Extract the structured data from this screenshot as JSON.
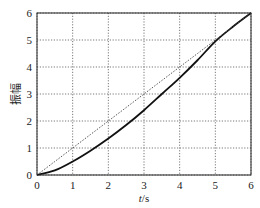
{
  "chart_data": {
    "type": "line",
    "title": "",
    "xlabel": "t/s",
    "ylabel": "振幅",
    "xlim": [
      0,
      6
    ],
    "ylim": [
      0,
      6
    ],
    "grid": true,
    "legend": null,
    "xticks": [
      "0",
      "1",
      "2",
      "3",
      "4",
      "5",
      "6"
    ],
    "yticks": [
      "0",
      "1",
      "2",
      "3",
      "4",
      "5",
      "6"
    ],
    "x": [
      0,
      0.5,
      1,
      1.5,
      2,
      2.5,
      3,
      3.5,
      4,
      4.5,
      5,
      5.5,
      6
    ],
    "series": [
      {
        "name": "response",
        "style": "solid",
        "color": "#111111",
        "values": [
          0,
          0.17,
          0.5,
          0.9,
          1.35,
          1.85,
          2.4,
          3.0,
          3.6,
          4.25,
          4.95,
          5.5,
          6.0
        ]
      },
      {
        "name": "reference",
        "style": "dotted",
        "color": "#444444",
        "values": [
          0,
          0.5,
          1,
          1.5,
          2,
          2.5,
          3,
          3.5,
          4,
          4.5,
          5,
          5.5,
          6
        ]
      }
    ]
  }
}
